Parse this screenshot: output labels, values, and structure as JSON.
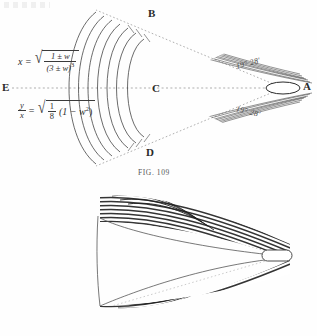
{
  "page": {
    "background_color": "#fefefe",
    "ink_color": "#2a2a2a"
  },
  "figure_109": {
    "caption": "FIG. 109",
    "point_labels": {
      "a": "A",
      "b": "B",
      "c": "C",
      "d": "D",
      "e": "E"
    },
    "angles": {
      "upper": "19° 28'",
      "lower": "19° 28'"
    },
    "formulas": {
      "x": {
        "lhs": "x",
        "equals": "=",
        "radicand_numerator": "1 ± w",
        "radicand_denominator": "(3 ± w)",
        "denominator_exponent": "3"
      },
      "y_over_x": {
        "lhs_numerator": "y",
        "lhs_denominator": "x",
        "equals": "=",
        "radicand_fraction_numerator": "1",
        "radicand_fraction_denominator": "8",
        "radicand_factor": "(1 − w",
        "radicand_factor_exponent": "2",
        "radicand_factor_close": ")"
      }
    },
    "projectile_shape": "ellipse",
    "wave_front_count": 7,
    "ray_count": 6
  },
  "figure_110": {
    "caption": "FIG. 110.",
    "projectile_shape": "rounded-rectangle",
    "band_count": 22,
    "cone_guide_style": "dotted"
  }
}
